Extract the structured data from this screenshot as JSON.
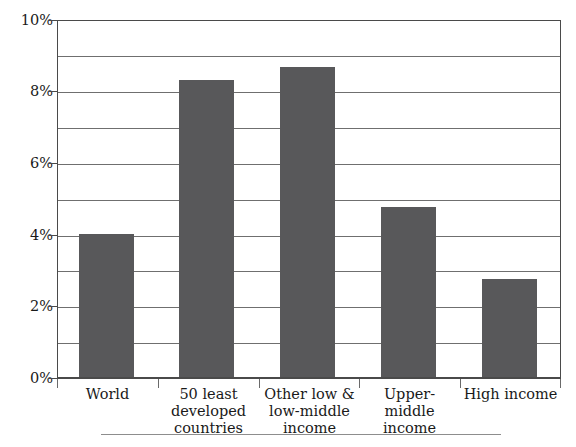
{
  "chart_data": {
    "type": "bar",
    "title": "",
    "subtitle": "",
    "xlabel": "",
    "ylabel": "",
    "categories": [
      "World",
      "50 least developed countries",
      "Other low & low-middle income",
      "Upper-middle income",
      "High income"
    ],
    "values": [
      4.0,
      8.3,
      8.65,
      4.75,
      2.75
    ],
    "value_unit": "%",
    "ylim": [
      0,
      10
    ],
    "ytick_labels": [
      "0%",
      "2%",
      "4%",
      "6%",
      "8%",
      "10%"
    ],
    "ytick_values": [
      0,
      2,
      4,
      6,
      8,
      10
    ],
    "gridline_values": [
      1,
      2,
      3,
      4,
      5,
      6,
      7,
      8,
      9,
      10
    ],
    "grid": true,
    "legend": null,
    "legend_position": "none",
    "series": [
      {
        "name": "",
        "values": [
          4.0,
          8.3,
          8.65,
          4.75,
          2.75
        ]
      }
    ]
  },
  "colors": {
    "bar": "#58585a",
    "gridline": "#6f6f6f",
    "axis": "#4a4a4a",
    "text": "#1a1a1a",
    "background": "#ffffff",
    "footer_rule": "#8d8d8d"
  },
  "axis": {
    "y_labels": [
      "10%",
      "8%",
      "6%",
      "4%",
      "2%",
      "0%"
    ],
    "x_labels": [
      {
        "lines": [
          "World"
        ]
      },
      {
        "lines": [
          "50 least",
          "developed",
          "countries"
        ]
      },
      {
        "lines": [
          "Other low &",
          "low-middle",
          "income"
        ]
      },
      {
        "lines": [
          "Upper-middle",
          "income"
        ]
      },
      {
        "lines": [
          "High income"
        ]
      }
    ]
  }
}
